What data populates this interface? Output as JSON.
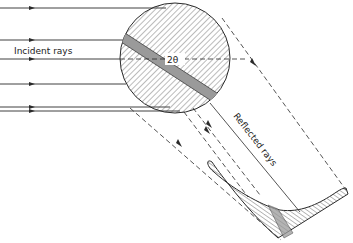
{
  "diagram": {
    "type": "x-ray diffraction geometry",
    "labels": {
      "incident": "Incident rays",
      "angle": "2θ",
      "reflected": "Reflected  rays"
    },
    "colors": {
      "line": "#2a2a2a",
      "hatch": "#555555",
      "band": "#9a9a9a",
      "background": "#ffffff"
    },
    "incident_ray_y": [
      8,
      40,
      59,
      84,
      107,
      111
    ],
    "circle": {
      "cx": 175,
      "cy": 58,
      "r": 55
    }
  }
}
